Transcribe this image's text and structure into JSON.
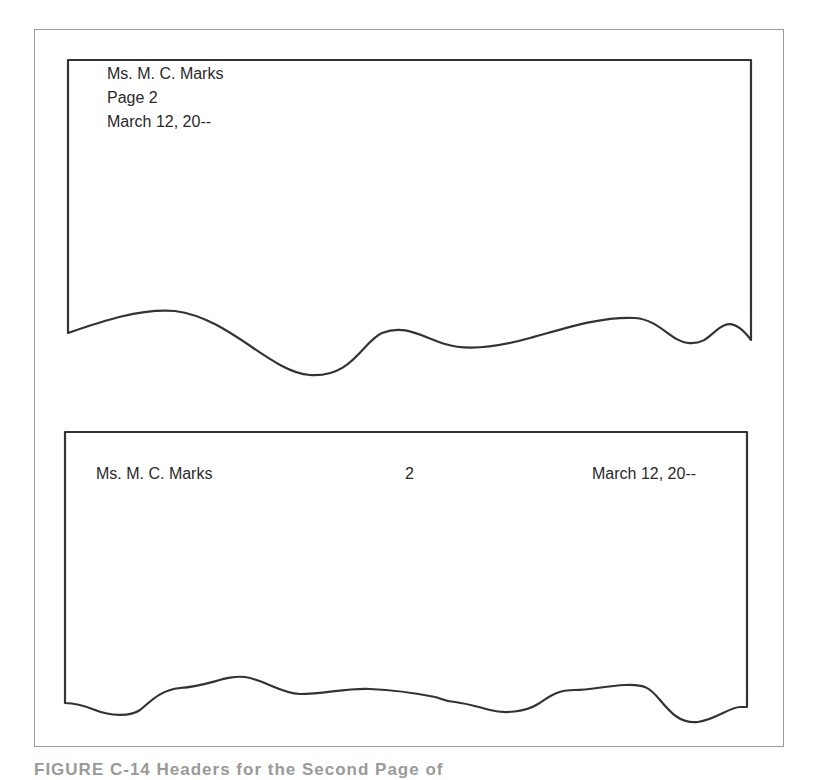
{
  "figure": {
    "caption_partial": "FIGURE C-14  Headers for the Second Page of"
  },
  "examples": [
    {
      "style": "block",
      "lines": [
        "Ms. M. C. Marks",
        "Page 2",
        "March 12, 20--"
      ]
    },
    {
      "style": "horizontal",
      "left": "Ms. M. C. Marks",
      "center": "2",
      "right": "March 12, 20--"
    }
  ],
  "colors": {
    "frame": "#9a9a9a",
    "page_outline": "#333333",
    "text": "#2a2a2a"
  }
}
